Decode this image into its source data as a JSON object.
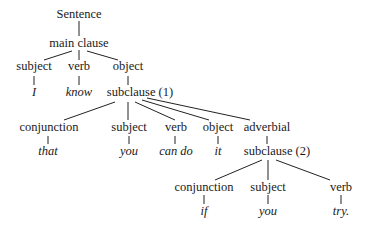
{
  "diagram": {
    "type": "syntax-tree",
    "nodes": {
      "sentence": "Sentence",
      "main_clause": "main clause",
      "mc_subject": "subject",
      "mc_verb": "verb",
      "mc_object": "object",
      "leaf_I": "I",
      "leaf_know": "know",
      "subclause1": "subclause (1)",
      "sc1_conjunction": "conjunction",
      "sc1_subject": "subject",
      "sc1_verb": "verb",
      "sc1_object": "object",
      "sc1_adverbial": "adverbial",
      "leaf_that": "that",
      "leaf_you1": "you",
      "leaf_can_do": "can do",
      "leaf_it": "it",
      "subclause2": "subclause (2)",
      "sc2_conjunction": "conjunction",
      "sc2_subject": "subject",
      "sc2_verb": "verb",
      "leaf_if": "if",
      "leaf_you2": "you",
      "leaf_try": "try."
    },
    "edges": [
      [
        "sentence",
        "main_clause"
      ],
      [
        "main_clause",
        "mc_subject"
      ],
      [
        "main_clause",
        "mc_verb"
      ],
      [
        "main_clause",
        "mc_object"
      ],
      [
        "mc_subject",
        "leaf_I"
      ],
      [
        "mc_verb",
        "leaf_know"
      ],
      [
        "mc_object",
        "subclause1"
      ],
      [
        "subclause1",
        "sc1_conjunction"
      ],
      [
        "subclause1",
        "sc1_subject"
      ],
      [
        "subclause1",
        "sc1_verb"
      ],
      [
        "subclause1",
        "sc1_object"
      ],
      [
        "subclause1",
        "sc1_adverbial"
      ],
      [
        "sc1_conjunction",
        "leaf_that"
      ],
      [
        "sc1_subject",
        "leaf_you1"
      ],
      [
        "sc1_verb",
        "leaf_can_do"
      ],
      [
        "sc1_object",
        "leaf_it"
      ],
      [
        "sc1_adverbial",
        "subclause2"
      ],
      [
        "subclause2",
        "sc2_conjunction"
      ],
      [
        "subclause2",
        "sc2_subject"
      ],
      [
        "subclause2",
        "sc2_verb"
      ],
      [
        "sc2_conjunction",
        "leaf_if"
      ],
      [
        "sc2_subject",
        "leaf_you2"
      ],
      [
        "sc2_verb",
        "leaf_try"
      ]
    ]
  }
}
